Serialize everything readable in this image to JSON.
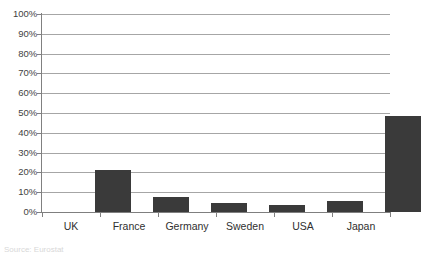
{
  "chart_data": {
    "type": "bar",
    "title": "",
    "subtitle": "",
    "xlabel": "",
    "ylabel": "",
    "categories": [
      "UK",
      "France",
      "Germany",
      "Sweden",
      "USA",
      "Japan"
    ],
    "values": [
      21,
      7.5,
      4.5,
      3.5,
      5.5,
      48.5
    ],
    "series": [
      {
        "name": "",
        "values": [
          21,
          7.5,
          4.5,
          3.5,
          5.5,
          48.5
        ]
      }
    ],
    "ylim": [
      0,
      100
    ],
    "ytick_labels": [
      "0%",
      "10%",
      "20%",
      "30%",
      "40%",
      "50%",
      "60%",
      "70%",
      "80%",
      "90%",
      "100%"
    ],
    "ytick_values": [
      0,
      10,
      20,
      30,
      40,
      50,
      60,
      70,
      80,
      90,
      100
    ],
    "grid": true,
    "grid_axis": "y",
    "legend": false,
    "legend_position": "none",
    "bar_color": "#3a3a3a",
    "gridline_color": "#a6a6a6",
    "axis_color": "#808080",
    "background_color": "#ffffff",
    "annotations": []
  },
  "footer": {
    "source_note": "Source: Eurostat"
  }
}
